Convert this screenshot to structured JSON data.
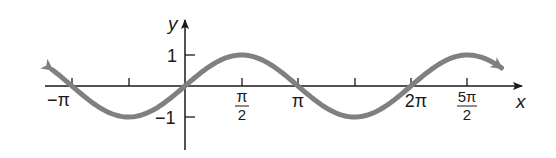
{
  "chart_data": {
    "type": "line",
    "title": "",
    "function": "y = sin x",
    "xlabel": "x",
    "ylabel": "y",
    "x_ticks": [
      {
        "value": -3.14159,
        "label": "−π"
      },
      {
        "value": -1.5708,
        "label": ""
      },
      {
        "value": 1.5708,
        "label": "π/2"
      },
      {
        "value": 3.14159,
        "label": "π"
      },
      {
        "value": 4.71239,
        "label": ""
      },
      {
        "value": 6.28319,
        "label": "2π"
      },
      {
        "value": 7.85398,
        "label": "5π/2"
      }
    ],
    "y_ticks": [
      {
        "value": 1,
        "label": "1"
      },
      {
        "value": -1,
        "label": "−1"
      }
    ],
    "xlim": [
      -3.8,
      9.5
    ],
    "ylim": [
      -1.8,
      1.8
    ],
    "series": [
      {
        "name": "sin x",
        "x_range": [
          -3.7,
          8.8
        ],
        "color": "#808080",
        "arrows": "both"
      }
    ],
    "grid": false,
    "legend": "none"
  },
  "labels": {
    "x_axis": "x",
    "y_axis": "y",
    "neg_pi": "−π",
    "pi_over_2_num": "π",
    "pi_over_2_den": "2",
    "pi": "π",
    "two_pi": "2π",
    "five_pi_over_2_num": "5π",
    "five_pi_over_2_den": "2",
    "y_one": "1",
    "y_neg_one": "−1"
  },
  "colors": {
    "axis": "#1a1a1a",
    "curve": "#808080"
  }
}
